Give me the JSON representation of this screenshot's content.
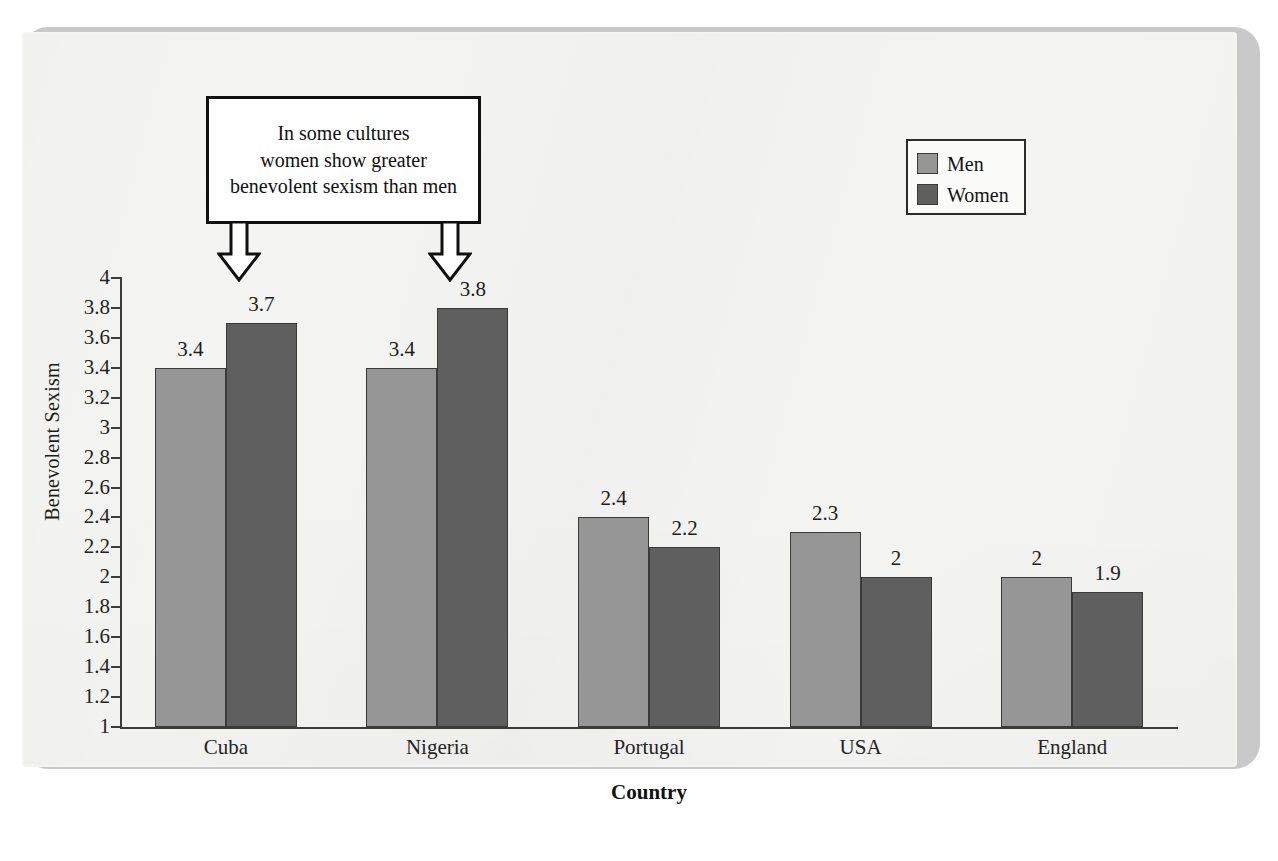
{
  "chart_data": {
    "type": "bar",
    "title": "",
    "xlabel": "Country",
    "ylabel": "Benevolent Sexism",
    "categories": [
      "Cuba",
      "Nigeria",
      "Portugal",
      "USA",
      "England"
    ],
    "series": [
      {
        "name": "Men",
        "color": "#969696",
        "values": [
          3.4,
          3.4,
          2.4,
          2.3,
          2
        ]
      },
      {
        "name": "Women",
        "color": "#5f5f5f",
        "values": [
          3.7,
          3.8,
          2.2,
          2,
          1.9
        ]
      }
    ],
    "value_labels": {
      "Men": [
        "3.4",
        "3.4",
        "2.4",
        "2.3",
        "2"
      ],
      "Women": [
        "3.7",
        "3.8",
        "2.2",
        "2",
        "1.9"
      ]
    },
    "ylim": [
      1,
      4
    ],
    "ytick_step": 0.2,
    "ytick_labels": [
      "4",
      "3.8",
      "3.6",
      "3.4",
      "3.2",
      "3",
      "2.8",
      "2.6",
      "2.4",
      "2.2",
      "2",
      "1.8",
      "1.6",
      "1.4",
      "1.2",
      "1"
    ],
    "grid": false,
    "legend_position": "top-right"
  },
  "legend": {
    "entries": [
      {
        "label": "Men",
        "color": "#969696"
      },
      {
        "label": "Women",
        "color": "#5f5f5f"
      }
    ]
  },
  "callout": {
    "lines": [
      "In some cultures",
      "women show greater",
      "benevolent sexism than men"
    ],
    "points_to": [
      "Cuba women bar",
      "Nigeria women bar"
    ]
  },
  "axes": {
    "x_title": "Country",
    "y_title": "Benevolent Sexism"
  }
}
